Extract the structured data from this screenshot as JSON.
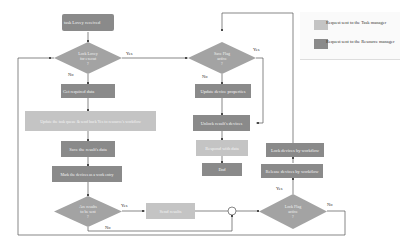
{
  "diagram": {
    "type": "flowchart",
    "colors": {
      "resource_manager": "#8a8a8a",
      "task_manager": "#c4c4c4",
      "line": "#555555"
    },
    "nodes": {
      "start": "task Lovey received",
      "decision_lock": "Lock Lovey\nfor execut\n?",
      "get_required": "Get required data",
      "update_task": "Update the task queue & send back Yes to resource's workflow",
      "save_data": "Save the result's data",
      "mark_devices": "Mark the devices as a work entry",
      "decision_all_ready": "Are results\nto be sent\n?",
      "final_results": "Send results",
      "decision_flag_top": "Save Flag\nactive\n?",
      "update_properties": "Update device properties",
      "unlock_devices": "Unlock result's devices",
      "respond": "Respond with data",
      "end": "End",
      "lock_devices": "Lock devices by workflow",
      "release_devices": "Release devices by workflow",
      "decision_flag_bottom": "Lock Flag\nactive\n?"
    },
    "edge_labels": {
      "lock_yes": "Yes",
      "lock_no": "No",
      "flag_top_yes": "Yes",
      "flag_top_no": "No",
      "ready_yes": "Yes",
      "ready_no": "No",
      "flag_bottom_no": "No",
      "release_yes": "Yes"
    },
    "legend": [
      {
        "label": "Request sent to the Task manager",
        "color": "#c4c4c4"
      },
      {
        "label": "Request sent to the Resource manager",
        "color": "#8a8a8a"
      }
    ]
  }
}
